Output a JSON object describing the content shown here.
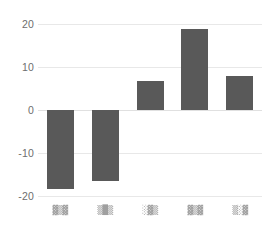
{
  "chart_data": {
    "type": "bar",
    "title": "",
    "subtitle": "",
    "xlabel": "",
    "ylabel": "",
    "categories": [
      "",
      "",
      "",
      "",
      ""
    ],
    "category_labels_legible": false,
    "category_label_glyphs": [
      "▓▒▓",
      "▒█▒",
      "░▓▒",
      "▓▒▓",
      "▒░▓"
    ],
    "values": [
      -18.3,
      -16.6,
      6.7,
      18.9,
      8.0
    ],
    "ylim": [
      -20,
      20
    ],
    "yticks": [
      20,
      10,
      0,
      -10,
      -20
    ],
    "ytick_labels": [
      "20",
      "10",
      "0",
      "-10",
      "-20"
    ],
    "grid": true,
    "grid_axis": "y",
    "legend": false,
    "legend_position": "none",
    "bar_color": "#595959",
    "grid_color": "#e8e8e8",
    "zero_line_color": "#e0e0e0",
    "background_color": "#ffffff",
    "tick_label_color": "#6e6e6e"
  }
}
